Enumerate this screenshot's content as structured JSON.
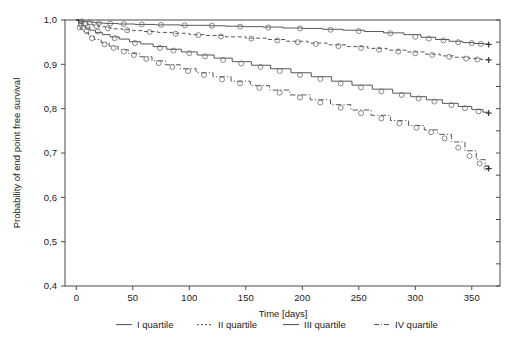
{
  "chart_data": {
    "type": "line",
    "title": "",
    "subtitle": "",
    "xlabel": "Time [days]",
    "ylabel": "Probability of end point free survival",
    "xlim": [
      -10,
      375
    ],
    "ylim": [
      0.4,
      1.0
    ],
    "xticks": [
      0,
      50,
      100,
      150,
      200,
      250,
      300,
      350
    ],
    "xticklabels": [
      "0",
      "50",
      "100",
      "150",
      "200",
      "250",
      "300",
      "350"
    ],
    "yticks": [
      0.4,
      0.5,
      0.6,
      0.7,
      0.8,
      0.9,
      1.0
    ],
    "yticklabels": [
      "0,4",
      "0,5",
      "0,6",
      "0,7",
      "0,8",
      "0,9",
      "1,0"
    ],
    "grid": false,
    "legend_position": "bottom",
    "decimal_separator": ",",
    "censor_marker": "circle",
    "end_marker": "plus",
    "line_color": "#3a3a3a",
    "marker_color": "#6b6b6b",
    "axis_color": "#4a4a4a",
    "series": [
      {
        "name": "I quartile",
        "linestyle": "solid",
        "x": [
          0,
          3,
          6,
          9,
          13,
          17,
          21,
          26,
          31,
          37,
          44,
          52,
          61,
          70,
          80,
          92,
          104,
          118,
          132,
          148,
          165,
          183,
          200,
          218,
          236,
          255,
          272,
          290,
          305,
          318,
          330,
          342,
          352,
          360,
          365
        ],
        "y": [
          1.0,
          0.998,
          0.997,
          0.996,
          0.995,
          0.994,
          0.993,
          0.992,
          0.992,
          0.991,
          0.991,
          0.99,
          0.99,
          0.989,
          0.989,
          0.988,
          0.988,
          0.987,
          0.986,
          0.985,
          0.984,
          0.982,
          0.981,
          0.979,
          0.977,
          0.974,
          0.971,
          0.967,
          0.961,
          0.956,
          0.952,
          0.949,
          0.947,
          0.946,
          0.945
        ],
        "censor_x": [
          5,
          12,
          20,
          30,
          42,
          58,
          75,
          96,
          120,
          145,
          170,
          198,
          225,
          250,
          278,
          300,
          312,
          325,
          338,
          350,
          358
        ],
        "censor_y": [
          0.997,
          0.995,
          0.993,
          0.992,
          0.991,
          0.99,
          0.989,
          0.988,
          0.987,
          0.985,
          0.983,
          0.981,
          0.978,
          0.975,
          0.97,
          0.962,
          0.958,
          0.954,
          0.95,
          0.948,
          0.946
        ],
        "endpoint": {
          "x": 365,
          "y": 0.945
        }
      },
      {
        "name": "II quartile",
        "linestyle": "dashed",
        "x": [
          0,
          3,
          6,
          10,
          15,
          20,
          26,
          33,
          41,
          50,
          60,
          72,
          85,
          100,
          115,
          132,
          150,
          168,
          186,
          205,
          222,
          240,
          258,
          275,
          292,
          308,
          322,
          335,
          348,
          358,
          365
        ],
        "y": [
          1.0,
          0.996,
          0.993,
          0.99,
          0.987,
          0.985,
          0.982,
          0.98,
          0.978,
          0.976,
          0.974,
          0.972,
          0.97,
          0.967,
          0.965,
          0.962,
          0.959,
          0.956,
          0.952,
          0.948,
          0.944,
          0.94,
          0.936,
          0.932,
          0.928,
          0.923,
          0.919,
          0.916,
          0.913,
          0.911,
          0.91
        ],
        "censor_x": [
          8,
          18,
          28,
          45,
          65,
          88,
          108,
          128,
          155,
          178,
          196,
          212,
          232,
          252,
          268,
          285,
          300,
          315,
          330,
          345,
          355
        ],
        "censor_y": [
          0.991,
          0.986,
          0.981,
          0.977,
          0.973,
          0.969,
          0.966,
          0.963,
          0.958,
          0.954,
          0.95,
          0.946,
          0.941,
          0.937,
          0.933,
          0.929,
          0.925,
          0.921,
          0.917,
          0.913,
          0.911
        ],
        "endpoint": {
          "x": 365,
          "y": 0.91
        }
      },
      {
        "name": "III quartile",
        "linestyle": "solid",
        "x": [
          0,
          2,
          5,
          8,
          12,
          17,
          23,
          30,
          38,
          47,
          57,
          68,
          80,
          93,
          107,
          122,
          138,
          155,
          172,
          190,
          208,
          226,
          244,
          262,
          280,
          296,
          310,
          324,
          338,
          350,
          360,
          365
        ],
        "y": [
          1.0,
          0.993,
          0.987,
          0.982,
          0.977,
          0.972,
          0.967,
          0.962,
          0.957,
          0.951,
          0.946,
          0.94,
          0.934,
          0.928,
          0.921,
          0.914,
          0.906,
          0.898,
          0.89,
          0.881,
          0.872,
          0.862,
          0.853,
          0.844,
          0.835,
          0.827,
          0.82,
          0.812,
          0.805,
          0.798,
          0.792,
          0.79
        ],
        "censor_x": [
          4,
          10,
          19,
          34,
          52,
          74,
          86,
          100,
          114,
          130,
          146,
          163,
          180,
          198,
          216,
          234,
          252,
          270,
          288,
          303,
          317,
          332,
          344,
          356
        ],
        "censor_y": [
          0.989,
          0.984,
          0.974,
          0.959,
          0.948,
          0.937,
          0.931,
          0.925,
          0.918,
          0.91,
          0.902,
          0.894,
          0.885,
          0.876,
          0.867,
          0.857,
          0.848,
          0.839,
          0.831,
          0.823,
          0.816,
          0.808,
          0.801,
          0.794
        ],
        "endpoint": {
          "x": 365,
          "y": 0.79
        }
      },
      {
        "name": "IV quartile",
        "linestyle": "dashdot",
        "x": [
          0,
          2,
          4,
          7,
          11,
          16,
          22,
          29,
          37,
          46,
          56,
          67,
          79,
          92,
          106,
          121,
          137,
          154,
          171,
          189,
          207,
          225,
          243,
          261,
          278,
          294,
          308,
          320,
          332,
          344,
          354,
          362,
          365
        ],
        "y": [
          1.0,
          0.988,
          0.979,
          0.971,
          0.963,
          0.956,
          0.949,
          0.941,
          0.933,
          0.925,
          0.917,
          0.908,
          0.899,
          0.89,
          0.881,
          0.872,
          0.862,
          0.852,
          0.842,
          0.831,
          0.82,
          0.809,
          0.797,
          0.785,
          0.773,
          0.762,
          0.752,
          0.742,
          0.725,
          0.705,
          0.685,
          0.67,
          0.665
        ],
        "censor_x": [
          3,
          9,
          14,
          25,
          33,
          42,
          51,
          62,
          73,
          85,
          99,
          113,
          129,
          145,
          162,
          180,
          198,
          216,
          234,
          252,
          270,
          286,
          301,
          314,
          326,
          338,
          348,
          357,
          363
        ],
        "censor_y": [
          0.983,
          0.975,
          0.959,
          0.945,
          0.937,
          0.929,
          0.921,
          0.912,
          0.903,
          0.894,
          0.885,
          0.876,
          0.866,
          0.857,
          0.847,
          0.836,
          0.825,
          0.814,
          0.802,
          0.79,
          0.778,
          0.767,
          0.757,
          0.747,
          0.733,
          0.712,
          0.693,
          0.676,
          0.667
        ],
        "endpoint": {
          "x": 365,
          "y": 0.665
        }
      }
    ]
  },
  "legend": {
    "items": [
      {
        "label": "I quartile",
        "style": "solid"
      },
      {
        "label": "II quartile",
        "style": "dashed"
      },
      {
        "label": "III quartile",
        "style": "solid"
      },
      {
        "label": "IV quartile",
        "style": "dashdot"
      }
    ]
  }
}
